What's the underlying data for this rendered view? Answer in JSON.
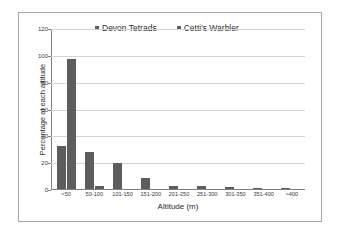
{
  "chart_data": {
    "type": "bar",
    "title": "",
    "xlabel": "Altitude (m)",
    "ylabel": "Percentage at each altitude",
    "categories": [
      "<50",
      "50-100",
      "101-150",
      "151-200",
      "201-250",
      "251-300",
      "301-350",
      "351-400",
      ">400"
    ],
    "series": [
      {
        "name": "Devon Tetrads",
        "values": [
          32,
          27.5,
          19.5,
          8.5,
          2,
          2,
          1.5,
          1,
          1
        ]
      },
      {
        "name": "Cetti's Warbler",
        "values": [
          97,
          2,
          0,
          0,
          0,
          0,
          0,
          0,
          0
        ]
      }
    ],
    "ylim": [
      0,
      120
    ],
    "yticks": [
      0,
      20,
      40,
      60,
      80,
      100,
      120
    ],
    "ytick_labels": [
      "0",
      "20",
      "40",
      "60",
      "80",
      "100",
      "120"
    ],
    "grid": true,
    "legend_position": "top-center",
    "bar_color": "#5d5d5d",
    "gridline_color": "#d4d4d4",
    "axis_color": "#808080",
    "border_color": "#a8a8a8",
    "background": "#ffffff"
  }
}
